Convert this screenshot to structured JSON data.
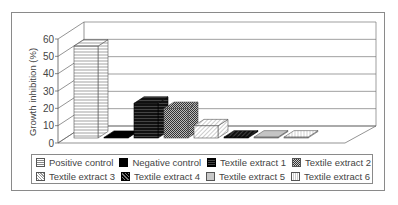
{
  "chart_data": {
    "type": "bar",
    "style": "3d-column",
    "title": "",
    "xlabel": "",
    "ylabel": "Growth inhibition (%)",
    "ylim": [
      0,
      60
    ],
    "yticks": [
      0,
      10,
      20,
      30,
      40,
      50,
      60
    ],
    "grid": true,
    "legend_position": "bottom",
    "categories": [
      "Positive control",
      "Negative control",
      "Textile extract 1",
      "Textile extract 2",
      "Textile extract 3",
      "Textile extract 4",
      "Textile extract 5",
      "Textile extract 6"
    ],
    "values": [
      53,
      0,
      20,
      17,
      7,
      0.5,
      0.5,
      0.5
    ]
  },
  "axis": {
    "ylabel": "Growth inhibition (%)",
    "ticks": [
      "0",
      "10",
      "20",
      "30",
      "40",
      "50",
      "60"
    ]
  },
  "legend": {
    "row1": [
      {
        "label": "Positive control",
        "pattern": "horizontal-lines"
      },
      {
        "label": "Negative control",
        "pattern": "solid-black"
      },
      {
        "label": "Textile extract 1",
        "pattern": "black-horizontal-stripes"
      },
      {
        "label": "Textile extract 2",
        "pattern": "checkered"
      }
    ],
    "row2": [
      {
        "label": "Textile extract 3",
        "pattern": "light-diagonal"
      },
      {
        "label": "Textile extract 4",
        "pattern": "dark-diagonal"
      },
      {
        "label": "Textile extract 5",
        "pattern": "gray"
      },
      {
        "label": "Textile extract 6",
        "pattern": "vertical-lines"
      }
    ]
  }
}
